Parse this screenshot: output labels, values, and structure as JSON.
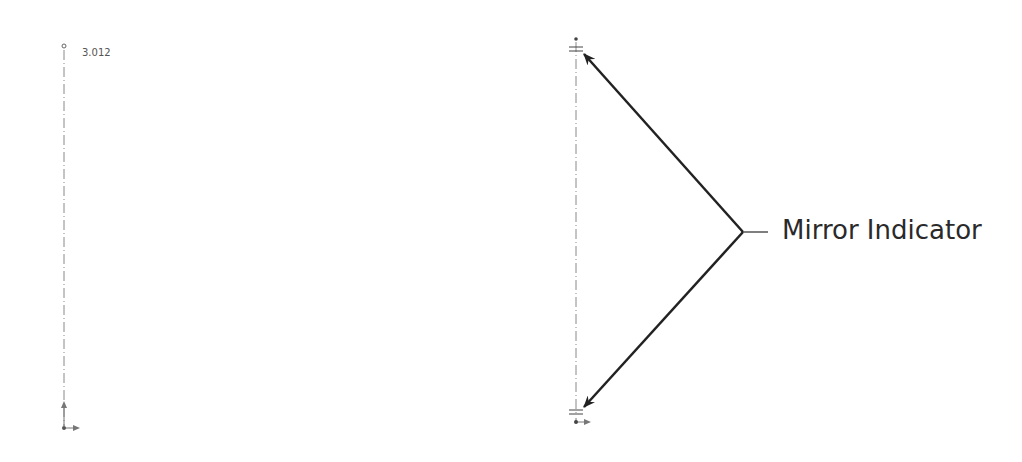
{
  "left_sketch": {
    "dimension_label": "3.012"
  },
  "callout": {
    "label": "Mirror Indicator"
  },
  "colors": {
    "line": "#222222",
    "centerline": "#888888",
    "text": "#2a2a2a"
  }
}
